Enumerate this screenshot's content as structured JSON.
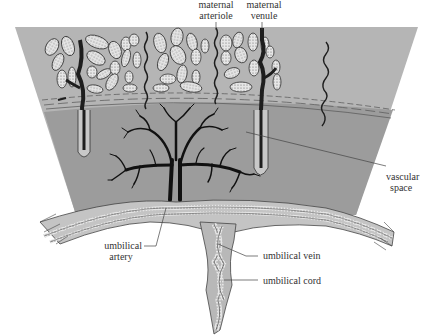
{
  "figure": {
    "colors": {
      "background": "#ffffff",
      "maternal_tissue": "#b5b5b5",
      "vascular_space": "#9c9c9c",
      "membrane_band": "#c4c4c4",
      "vessel_dark": "#1e1e1e",
      "line": "#444444",
      "text": "#333333"
    }
  },
  "labels": {
    "maternal_arteriole": {
      "line1": "maternal",
      "line2": "arteriole"
    },
    "maternal_venule": {
      "line1": "maternal",
      "line2": "venule"
    },
    "vascular_space": {
      "line1": "vascular",
      "line2": "space"
    },
    "umbilical_artery": {
      "line1": "umbilical",
      "line2": "artery"
    },
    "umbilical_vein": {
      "text": "umbilical vein"
    },
    "umbilical_cord": {
      "text": "umbilical cord"
    }
  }
}
